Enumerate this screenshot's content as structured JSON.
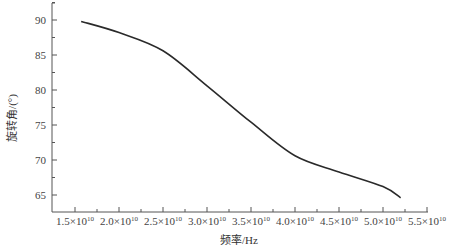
{
  "chart_data": {
    "type": "line",
    "title": "",
    "xlabel": "频率/Hz",
    "ylabel": "旋转角/(°)",
    "xlim": [
      15000000000.0,
      55000000000.0
    ],
    "ylim": [
      62.5,
      92.5
    ],
    "grid": false,
    "legend": null,
    "x_ticks": [
      15000000000.0,
      20000000000.0,
      25000000000.0,
      30000000000.0,
      35000000000.0,
      40000000000.0,
      45000000000.0,
      50000000000.0,
      55000000000.0
    ],
    "x_tick_labels": [
      {
        "mant": "1.5",
        "exp": "10"
      },
      {
        "mant": "2.0",
        "exp": "10"
      },
      {
        "mant": "2.5",
        "exp": "10"
      },
      {
        "mant": "3.0",
        "exp": "10"
      },
      {
        "mant": "3.5",
        "exp": "10"
      },
      {
        "mant": "4.0",
        "exp": "10"
      },
      {
        "mant": "4.5",
        "exp": "10"
      },
      {
        "mant": "5.0",
        "exp": "10"
      },
      {
        "mant": "5.5",
        "exp": "10"
      }
    ],
    "y_ticks": [
      65,
      70,
      75,
      80,
      85,
      90
    ],
    "y_tick_labels": [
      "65",
      "70",
      "75",
      "80",
      "85",
      "90"
    ],
    "series": [
      {
        "name": "旋转角",
        "color": "#2a2a2a",
        "x": [
          15700000000.0,
          20000000000.0,
          25000000000.0,
          30000000000.0,
          35000000000.0,
          40000000000.0,
          45000000000.0,
          50000000000.0,
          52000000000.0
        ],
        "values": [
          89.8,
          88.2,
          85.6,
          80.6,
          75.4,
          70.6,
          68.3,
          66.2,
          64.6
        ]
      }
    ]
  },
  "labels": {
    "xlabel": "频率/Hz",
    "ylabel": "旋转角/(°)",
    "times": "×"
  }
}
